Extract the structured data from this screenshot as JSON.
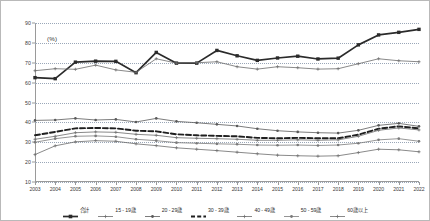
{
  "chart_data": {
    "type": "line",
    "title": "",
    "subtitle": "",
    "xlabel": "",
    "ylabel": "",
    "unit_label": "(%)",
    "ylim": [
      10,
      90
    ],
    "yticks": [
      10,
      20,
      30,
      40,
      50,
      60,
      70,
      80,
      90
    ],
    "grid": true,
    "legend_position": "bottom",
    "x": [
      2003,
      2004,
      2005,
      2006,
      2007,
      2008,
      2009,
      2010,
      2011,
      2012,
      2013,
      2014,
      2015,
      2016,
      2017,
      2018,
      2019,
      2020,
      2021,
      2022
    ],
    "categories": [
      "2003",
      "2004",
      "2005",
      "2006",
      "2007",
      "2008",
      "2009",
      "2010",
      "2011",
      "2012",
      "2013",
      "2014",
      "2015",
      "2016",
      "2017",
      "2018",
      "2019",
      "2020",
      "2021",
      "2022"
    ],
    "series": [
      {
        "name": "合計",
        "values": [
          62.5,
          62.0,
          70.3,
          70.8,
          70.7,
          65.0,
          75.2,
          69.8,
          69.8,
          76.2,
          73.5,
          71.2,
          72.4,
          73.3,
          71.9,
          72.3,
          79.0,
          84.0,
          85.3,
          86.8
        ]
      },
      {
        "name": "15 - 19歳",
        "values": [
          66.0,
          67.0,
          66.7,
          68.8,
          66.4,
          65.2,
          72.0,
          69.8,
          70.0,
          70.5,
          68.0,
          66.8,
          68.0,
          67.5,
          66.8,
          67.0,
          69.5,
          72.0,
          71.0,
          70.5
        ]
      },
      {
        "name": "20 - 29歳",
        "values": [
          41.0,
          41.2,
          42.0,
          41.2,
          41.5,
          40.2,
          42.0,
          40.5,
          39.8,
          39.0,
          38.2,
          36.8,
          35.8,
          35.2,
          34.8,
          34.6,
          36.0,
          38.5,
          39.5,
          38.0
        ]
      },
      {
        "name": "30 - 39歳",
        "values": [
          33.5,
          35.2,
          37.0,
          37.2,
          37.0,
          35.8,
          35.5,
          34.0,
          33.5,
          33.2,
          33.0,
          32.2,
          32.0,
          32.2,
          32.0,
          32.0,
          33.8,
          36.8,
          38.0,
          37.0
        ]
      },
      {
        "name": "40 - 49歳",
        "values": [
          31.5,
          33.0,
          34.8,
          35.2,
          35.0,
          34.0,
          33.5,
          32.3,
          32.0,
          31.8,
          31.5,
          31.0,
          31.0,
          31.2,
          31.0,
          31.2,
          33.0,
          36.0,
          37.2,
          36.2
        ]
      },
      {
        "name": "50 - 59歳",
        "values": [
          30.0,
          31.8,
          33.0,
          33.2,
          32.8,
          31.5,
          30.8,
          29.8,
          29.5,
          29.2,
          29.0,
          28.6,
          28.5,
          28.6,
          28.4,
          28.6,
          29.5,
          31.2,
          31.8,
          30.5
        ]
      },
      {
        "name": "60歳以上",
        "values": [
          23.8,
          28.2,
          30.2,
          30.8,
          30.5,
          29.2,
          28.3,
          27.2,
          26.5,
          25.8,
          25.0,
          24.2,
          23.5,
          23.2,
          23.0,
          23.2,
          24.8,
          26.5,
          26.2,
          25.2
        ]
      }
    ],
    "series_styles": [
      {
        "color": "#2b2b2b",
        "width": 1.7,
        "dash": "none",
        "marker": "square"
      },
      {
        "color": "#6b6b6b",
        "width": 0.8,
        "dash": "none",
        "marker": "plus"
      },
      {
        "color": "#5a5a5a",
        "width": 0.8,
        "dash": "none",
        "marker": "circle"
      },
      {
        "color": "#1f1f1f",
        "width": 1.9,
        "dash": "dashed",
        "marker": "none"
      },
      {
        "color": "#6b6b6b",
        "width": 0.8,
        "dash": "none",
        "marker": "plus"
      },
      {
        "color": "#7a7a7a",
        "width": 0.8,
        "dash": "none",
        "marker": "circle"
      },
      {
        "color": "#6b6b6b",
        "width": 0.8,
        "dash": "none",
        "marker": "plus"
      }
    ]
  }
}
